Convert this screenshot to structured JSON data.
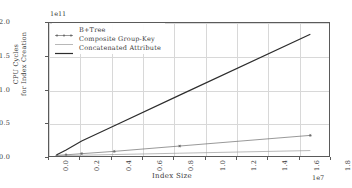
{
  "chart_data": {
    "type": "line",
    "title": "",
    "xlabel": "Index Size",
    "ylabel": "CPU Cycles\nfor Index Creation",
    "ylabel_line1": "CPU Cycles",
    "ylabel_line2": "for Index Creation",
    "x_offset_text": "1e7",
    "y_offset_text": "1e11",
    "xlim": [
      0.0,
      1.8
    ],
    "ylim": [
      0.0,
      2.0
    ],
    "x_unit_scale": 10000000.0,
    "y_unit_scale": 100000000000.0,
    "xticks": [
      "0.0",
      "0.2",
      "0.4",
      "0.6",
      "0.8",
      "1.0",
      "1.2",
      "1.4",
      "1.6",
      "1.8"
    ],
    "yticks": [
      "0.0",
      "0.5",
      "1.0",
      "1.5",
      "2.0"
    ],
    "grid": true,
    "legend_position": "upper left",
    "series": [
      {
        "name": "B+Tree",
        "marker": "star",
        "color": "#6b6b6b",
        "linewidth": 0.7,
        "x": [
          0.05,
          0.11,
          0.21,
          0.42,
          0.84,
          1.68
        ],
        "values": [
          0.01,
          0.018,
          0.035,
          0.07,
          0.15,
          0.31
        ]
      },
      {
        "name": "Composite Group-Key",
        "marker": "none",
        "color": "#9a9a9a",
        "linewidth": 0.7,
        "x": [
          0.05,
          0.11,
          0.21,
          0.42,
          0.84,
          1.68
        ],
        "values": [
          0.004,
          0.007,
          0.012,
          0.022,
          0.042,
          0.082
        ]
      },
      {
        "name": "Concatenated Attribute",
        "marker": "none",
        "color": "#2d2d2d",
        "linewidth": 1.2,
        "x": [
          0.05,
          0.11,
          0.21,
          0.42,
          0.84,
          1.68
        ],
        "values": [
          0.02,
          0.09,
          0.225,
          0.455,
          0.915,
          1.83
        ]
      }
    ]
  }
}
